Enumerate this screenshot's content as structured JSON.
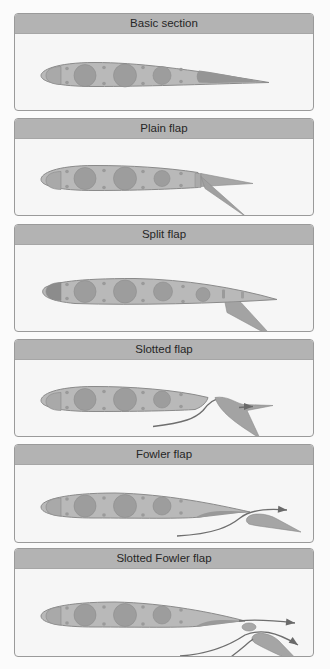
{
  "colors": {
    "header_bg": "#b3b3b3",
    "panel_bg": "#f6f6f6",
    "panel_border": "#9a9a9a",
    "wing_fill": "#b9b9b9",
    "wing_stroke": "#8a8a8a",
    "hole_fill": "#9d9d9d",
    "flap_fill": "#a8a8a8",
    "flap_dark": "#8f8f8f",
    "airflow_stroke": "#6e6e6e"
  },
  "panels": [
    {
      "title": "Basic section",
      "top": 13,
      "height": 98,
      "type": "basic"
    },
    {
      "title": "Plain flap",
      "top": 118,
      "height": 98,
      "type": "plain"
    },
    {
      "title": "Split flap",
      "top": 224,
      "height": 108,
      "type": "split"
    },
    {
      "title": "Slotted flap",
      "top": 339,
      "height": 98,
      "type": "slotted"
    },
    {
      "title": "Fowler flap",
      "top": 444,
      "height": 99,
      "type": "fowler"
    },
    {
      "title": "Slotted Fowler flap",
      "top": 548,
      "height": 109,
      "type": "slotted-fowler"
    }
  ]
}
